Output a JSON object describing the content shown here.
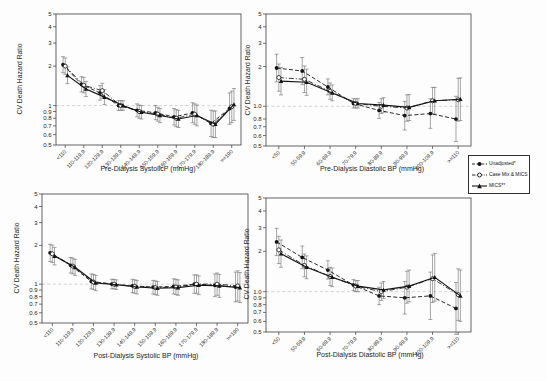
{
  "figure": {
    "ref_line": 1.0,
    "ink_color": "#141414",
    "errorbar_color": "#6b6b6b",
    "refline_color": "#c8c8c8",
    "legend": {
      "items": [
        {
          "label": "Unadjusted*",
          "marker": "filled-circle",
          "line": "dashed"
        },
        {
          "label": "Case Mix & MICS",
          "marker": "open-circle",
          "line": "dash-dot"
        },
        {
          "label": "MICS**",
          "marker": "filled-triangle",
          "line": "solid"
        }
      ]
    }
  },
  "chart_data": [
    {
      "id": "pre_systolic",
      "type": "line",
      "title": "",
      "xlabel": "Pre-Dialysis SystolicP (mmHg)",
      "ylabel": "CV Death Hazard Ratio",
      "y_scale": "log",
      "ylim": [
        0.5,
        5
      ],
      "grid": false,
      "y_tick_values": [
        5,
        4,
        3,
        2,
        1,
        0.9,
        0.8,
        0.7,
        0.6,
        0.5
      ],
      "y_tick_labels": [
        "5",
        "4",
        "3",
        "2",
        "1",
        "0.9",
        "0.8",
        "0.7",
        "0.6",
        "0.5"
      ],
      "categories": [
        "<110",
        "110-119.9",
        "120-129.9",
        "130-139.9",
        "140-149.9",
        "150-159.9",
        "160-169.9",
        "170-179.9",
        "180-189.9",
        ">=190"
      ],
      "series": [
        {
          "name": "Unadjusted*",
          "values": [
            2.05,
            1.45,
            1.25,
            1.0,
            0.92,
            0.88,
            0.82,
            0.88,
            0.73,
            0.95
          ],
          "lo": [
            1.78,
            1.27,
            1.1,
            0.92,
            0.82,
            0.78,
            0.71,
            0.74,
            0.58,
            0.72
          ],
          "hi": [
            2.36,
            1.66,
            1.42,
            1.09,
            1.03,
            1.0,
            0.95,
            1.05,
            0.92,
            1.25
          ]
        },
        {
          "name": "Case Mix & MICS",
          "values": [
            2.0,
            1.43,
            1.3,
            1.0,
            0.9,
            0.86,
            0.8,
            0.86,
            0.72,
            0.98
          ],
          "lo": [
            1.73,
            1.25,
            1.14,
            0.92,
            0.8,
            0.76,
            0.69,
            0.72,
            0.57,
            0.74
          ],
          "hi": [
            2.31,
            1.64,
            1.48,
            1.09,
            1.01,
            0.97,
            0.93,
            1.03,
            0.91,
            1.29
          ]
        },
        {
          "name": "MICS**",
          "values": [
            1.7,
            1.34,
            1.16,
            1.0,
            0.89,
            0.84,
            0.79,
            0.84,
            0.72,
            1.02
          ],
          "lo": [
            1.47,
            1.17,
            1.02,
            0.92,
            0.79,
            0.74,
            0.68,
            0.7,
            0.57,
            0.77
          ],
          "hi": [
            1.97,
            1.53,
            1.32,
            1.09,
            1.0,
            0.95,
            0.92,
            1.01,
            0.91,
            1.35
          ]
        }
      ]
    },
    {
      "id": "pre_diastolic",
      "type": "line",
      "title": "",
      "xlabel": "Pre-Dialysis Diastolic BP (mmHg)",
      "ylabel": "CV Death Hazard Ratio",
      "y_scale": "log",
      "ylim": [
        0.5,
        5
      ],
      "grid": false,
      "y_tick_values": [
        5,
        4,
        3,
        2,
        1,
        0.8,
        0.7,
        0.6,
        0.5
      ],
      "y_tick_labels": [
        "5",
        "4",
        "3",
        "2",
        "1.0",
        "0.8",
        "0.7",
        "0.6",
        "0.5"
      ],
      "categories": [
        "<50",
        "50-59.9",
        "60-69.9",
        "70-79.9",
        "80-89.9",
        "90-99.9",
        "100-109.9",
        ">=110"
      ],
      "series": [
        {
          "name": "Unadjusted*",
          "values": [
            1.95,
            1.85,
            1.4,
            1.05,
            0.93,
            0.85,
            0.88,
            0.8
          ],
          "lo": [
            1.53,
            1.46,
            1.22,
            0.97,
            0.81,
            0.66,
            0.68,
            0.54
          ],
          "hi": [
            2.48,
            2.34,
            1.61,
            1.14,
            1.07,
            1.09,
            1.14,
            1.19
          ]
        },
        {
          "name": "Case Mix & MICS",
          "values": [
            1.65,
            1.6,
            1.3,
            1.05,
            1.0,
            0.97,
            1.1,
            1.12
          ],
          "lo": [
            1.3,
            1.27,
            1.13,
            0.97,
            0.88,
            0.77,
            0.87,
            0.77
          ],
          "hi": [
            2.09,
            2.02,
            1.5,
            1.14,
            1.14,
            1.22,
            1.39,
            1.63
          ]
        },
        {
          "name": "MICS**",
          "values": [
            1.55,
            1.52,
            1.26,
            1.05,
            1.02,
            0.98,
            1.1,
            1.13
          ],
          "lo": [
            1.22,
            1.21,
            1.1,
            0.97,
            0.9,
            0.78,
            0.87,
            0.78
          ],
          "hi": [
            1.97,
            1.91,
            1.45,
            1.14,
            1.16,
            1.23,
            1.39,
            1.64
          ]
        }
      ]
    },
    {
      "id": "post_systolic",
      "type": "line",
      "title": "",
      "xlabel": "Post-Dialysis Systolic BP (mmHg)",
      "ylabel": "CV Death Hazard Ratio",
      "y_scale": "log",
      "ylim": [
        0.5,
        5
      ],
      "grid": false,
      "y_tick_values": [
        5,
        4,
        3,
        2,
        1,
        0.9,
        0.8,
        0.7,
        0.6,
        0.5
      ],
      "y_tick_labels": [
        "5",
        "4",
        "3",
        "2",
        "1",
        "0.9",
        "0.8",
        "0.7",
        "0.6",
        "0.5"
      ],
      "categories": [
        "<110",
        "110-119.9",
        "120-129.9",
        "130-139.9",
        "140-149.9",
        "150-159.9",
        "160-169.9",
        "170-179.9",
        "180-189.9",
        ">=190"
      ],
      "series": [
        {
          "name": "Unadjusted*",
          "values": [
            1.75,
            1.4,
            1.05,
            1.0,
            0.97,
            0.95,
            0.96,
            1.0,
            0.98,
            0.95
          ],
          "lo": [
            1.5,
            1.22,
            0.92,
            0.92,
            0.86,
            0.84,
            0.84,
            0.85,
            0.8,
            0.73
          ],
          "hi": [
            2.04,
            1.61,
            1.2,
            1.09,
            1.09,
            1.07,
            1.1,
            1.18,
            1.2,
            1.24
          ]
        },
        {
          "name": "Case Mix & MICS",
          "values": [
            1.72,
            1.38,
            1.04,
            1.0,
            0.96,
            0.94,
            0.95,
            1.0,
            1.0,
            0.97
          ],
          "lo": [
            1.47,
            1.2,
            0.91,
            0.92,
            0.85,
            0.83,
            0.83,
            0.85,
            0.82,
            0.74
          ],
          "hi": [
            2.01,
            1.59,
            1.19,
            1.09,
            1.08,
            1.06,
            1.09,
            1.18,
            1.22,
            1.27
          ]
        },
        {
          "name": "MICS**",
          "values": [
            1.65,
            1.35,
            1.02,
            0.99,
            0.95,
            0.93,
            0.94,
            0.98,
            0.97,
            0.94
          ],
          "lo": [
            1.41,
            1.17,
            0.89,
            0.91,
            0.84,
            0.82,
            0.82,
            0.83,
            0.79,
            0.72
          ],
          "hi": [
            1.93,
            1.56,
            1.17,
            1.08,
            1.07,
            1.05,
            1.08,
            1.16,
            1.19,
            1.23
          ]
        }
      ]
    },
    {
      "id": "post_diastolic",
      "type": "line",
      "title": "",
      "xlabel": "Post-Dialysis Diastolic BP (mmHg)",
      "ylabel": "CV Death Hazard Ratio",
      "y_scale": "log",
      "ylim": [
        0.5,
        5
      ],
      "grid": false,
      "y_tick_values": [
        5,
        4,
        3,
        2,
        1,
        0.9,
        0.8,
        0.7,
        0.6,
        0.5
      ],
      "y_tick_labels": [
        "5",
        "4",
        "3",
        "2",
        "1.0",
        "0.9",
        "0.8",
        "0.7",
        "0.6",
        "0.5"
      ],
      "categories": [
        "<50",
        "50-59.9",
        "60-69.9",
        "70-79.9",
        "80-89.9",
        "90-99.9",
        "100-109.9",
        ">=110"
      ],
      "series": [
        {
          "name": "Unadjusted*",
          "values": [
            2.35,
            1.8,
            1.45,
            1.12,
            0.93,
            0.9,
            0.93,
            0.75
          ],
          "lo": [
            1.86,
            1.48,
            1.24,
            1.02,
            0.8,
            0.68,
            0.62,
            0.48
          ],
          "hi": [
            2.97,
            2.19,
            1.7,
            1.23,
            1.08,
            1.19,
            1.4,
            1.17
          ]
        },
        {
          "name": "Case Mix & MICS",
          "values": [
            2.05,
            1.57,
            1.3,
            1.1,
            1.0,
            1.08,
            1.25,
            0.95
          ],
          "lo": [
            1.62,
            1.29,
            1.11,
            1.0,
            0.86,
            0.82,
            0.83,
            0.61
          ],
          "hi": [
            2.59,
            1.91,
            1.52,
            1.21,
            1.16,
            1.42,
            1.88,
            1.48
          ]
        },
        {
          "name": "MICS**",
          "values": [
            1.92,
            1.52,
            1.28,
            1.1,
            1.03,
            1.1,
            1.28,
            0.93
          ],
          "lo": [
            1.52,
            1.25,
            1.09,
            1.0,
            0.89,
            0.84,
            0.85,
            0.6
          ],
          "hi": [
            2.43,
            1.85,
            1.5,
            1.21,
            1.19,
            1.45,
            1.93,
            1.45
          ]
        }
      ]
    }
  ]
}
